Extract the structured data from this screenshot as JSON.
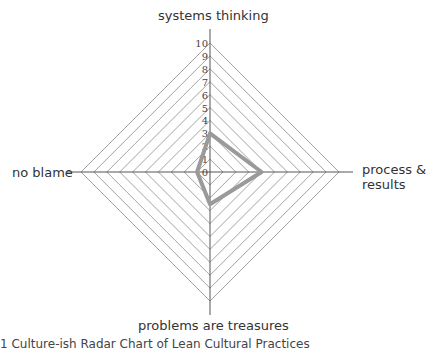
{
  "chart_data": {
    "type": "radar",
    "title": "",
    "axes": [
      "systems thinking",
      "process & results",
      "problems are treasures",
      "no blame"
    ],
    "scale": {
      "min": 0,
      "max": 10,
      "ticks": [
        0,
        1,
        2,
        3,
        4,
        5,
        6,
        7,
        8,
        9,
        10
      ]
    },
    "series": [
      {
        "name": "culture",
        "values": [
          3,
          4,
          2.5,
          1
        ],
        "color": "#9a9a9a"
      }
    ],
    "grid": true
  },
  "labels": {
    "top": "systems thinking",
    "right_line1": "process &",
    "right_line2": "results",
    "bottom": "problems are treasures",
    "left": "no blame"
  },
  "caption": "1 Culture-ish Radar Chart of Lean Cultural Practices"
}
